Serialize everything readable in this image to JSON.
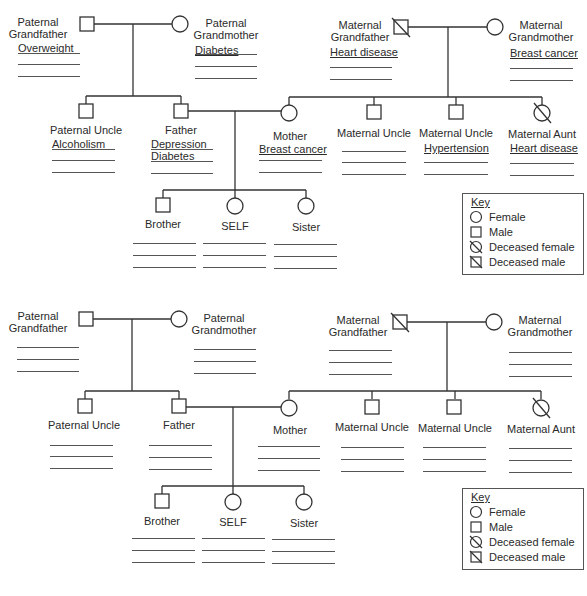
{
  "key": {
    "title": "Key",
    "items": [
      {
        "symbol": "circle-icon",
        "label": "Female"
      },
      {
        "symbol": "square-icon",
        "label": "Male"
      },
      {
        "symbol": "crossed-circle-icon",
        "label": "Deceased female"
      },
      {
        "symbol": "crossed-square-icon",
        "label": "Deceased male"
      }
    ]
  },
  "filled": {
    "paternal_grandfather": {
      "line1": "Paternal",
      "line2": "Grandfather",
      "conditions": [
        "Overweight"
      ]
    },
    "paternal_grandmother": {
      "line1": "Paternal",
      "line2": "Grandmother",
      "conditions": [
        "Diabetes"
      ]
    },
    "maternal_grandfather": {
      "line1": "Maternal",
      "line2": "Grandfather",
      "conditions": [
        "Heart disease"
      ]
    },
    "maternal_grandmother": {
      "line1": "Maternal",
      "line2": "Grandmother",
      "conditions": [
        "Breast cancer"
      ]
    },
    "paternal_uncle": {
      "label": "Paternal Uncle",
      "conditions": [
        "Alcoholism"
      ]
    },
    "father": {
      "label": "Father",
      "conditions": [
        "Depression",
        "Diabetes"
      ]
    },
    "mother": {
      "label": "Mother",
      "conditions": [
        "Breast cancer"
      ]
    },
    "maternal_uncle_1": {
      "label": "Maternal Uncle",
      "conditions": []
    },
    "maternal_uncle_2": {
      "label": "Maternal Uncle",
      "conditions": [
        "Hypertension"
      ]
    },
    "maternal_aunt": {
      "label": "Maternal Aunt",
      "conditions": [
        "Heart disease"
      ]
    },
    "brother": {
      "label": "Brother"
    },
    "self": {
      "label": "SELF"
    },
    "sister": {
      "label": "Sister"
    }
  },
  "blank": {
    "paternal_grandfather": {
      "line1": "Paternal",
      "line2": "Grandfather"
    },
    "paternal_grandmother": {
      "line1": "Paternal",
      "line2": "Grandmother"
    },
    "maternal_grandfather": {
      "line1": "Maternal",
      "line2": "Grandfather"
    },
    "maternal_grandmother": {
      "line1": "Maternal",
      "line2": "Grandmother"
    },
    "paternal_uncle": {
      "label": "Paternal Uncle"
    },
    "father": {
      "label": "Father"
    },
    "mother": {
      "label": "Mother"
    },
    "maternal_uncle_1": {
      "label": "Maternal Uncle"
    },
    "maternal_uncle_2": {
      "label": "Maternal Uncle"
    },
    "maternal_aunt": {
      "label": "Maternal Aunt"
    },
    "brother": {
      "label": "Brother"
    },
    "self": {
      "label": "SELF"
    },
    "sister": {
      "label": "Sister"
    }
  }
}
